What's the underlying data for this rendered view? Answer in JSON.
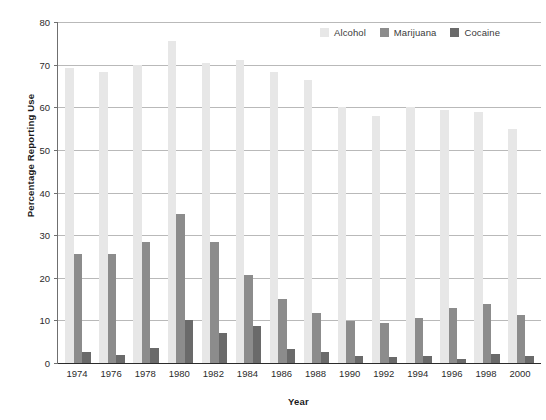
{
  "chart_data": {
    "type": "bar",
    "title": "",
    "xlabel": "Year",
    "ylabel": "Percentage Reporting Use",
    "ylim": [
      0,
      80
    ],
    "ytick_step": 10,
    "yticks": [
      0,
      10,
      20,
      30,
      40,
      50,
      60,
      70,
      80
    ],
    "grid": true,
    "legend_position": "top-right",
    "categories": [
      "1974",
      "1976",
      "1978",
      "1980",
      "1982",
      "1984",
      "1986",
      "1988",
      "1990",
      "1992",
      "1994",
      "1996",
      "1998",
      "2000"
    ],
    "series": [
      {
        "name": "Alcohol",
        "color": "#e7e7e7",
        "values": [
          69.3,
          68.3,
          70.0,
          75.5,
          70.3,
          71.0,
          68.3,
          66.5,
          60.0,
          58.0,
          60.0,
          59.3,
          59.0,
          55.0
        ]
      },
      {
        "name": "Marijuana",
        "color": "#8c8c8c",
        "values": [
          25.6,
          25.5,
          28.4,
          35.0,
          28.4,
          20.6,
          15.1,
          11.8,
          9.8,
          9.4,
          10.5,
          12.8,
          13.9,
          11.3
        ]
      },
      {
        "name": "Cocaine",
        "color": "#6a6a6a",
        "values": [
          2.6,
          1.8,
          3.6,
          10.0,
          7.0,
          8.8,
          3.3,
          2.6,
          1.7,
          1.5,
          1.6,
          1.0,
          2.2,
          1.6
        ]
      }
    ]
  },
  "legend": {
    "items": [
      {
        "label": "Alcohol",
        "swatch": "legend-swatch-alcohol"
      },
      {
        "label": "Marijuana",
        "swatch": "legend-swatch-marijuana"
      },
      {
        "label": "Cocaine",
        "swatch": "legend-swatch-cocaine"
      }
    ]
  },
  "axes": {
    "y_title": "Percentage Reporting Use",
    "x_title": "Year"
  }
}
